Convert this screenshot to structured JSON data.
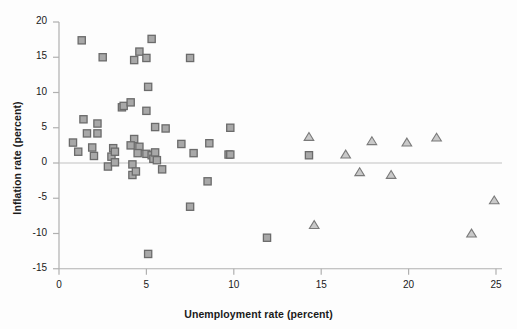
{
  "chart_data": {
    "type": "scatter",
    "title": "",
    "xlabel": "Unemployment rate (percent)",
    "ylabel": "Inflation rate (percent)",
    "xlim": [
      0,
      25
    ],
    "ylim": [
      -15,
      20
    ],
    "xticks": [
      0,
      5,
      10,
      15,
      20,
      25
    ],
    "yticks": [
      20,
      15,
      10,
      5,
      0,
      -5,
      -10,
      -15
    ],
    "xtick_labels": [
      "0",
      "5",
      "10",
      "15",
      "20",
      "25"
    ],
    "ytick_labels": [
      "20",
      "15",
      "10",
      "5",
      "0",
      "-5",
      "-10",
      "-15"
    ],
    "grid": false,
    "legend": "none",
    "zero_line": 0,
    "series": [
      {
        "name": "square-series",
        "marker": "square",
        "fill_color": "#a8a8a8",
        "edge_color": "#6b6b6b",
        "points": [
          [
            1.3,
            17.4
          ],
          [
            2.5,
            15.0
          ],
          [
            4.3,
            14.6
          ],
          [
            4.6,
            15.8
          ],
          [
            5.0,
            14.9
          ],
          [
            5.3,
            17.6
          ],
          [
            7.5,
            14.9
          ],
          [
            5.1,
            10.8
          ],
          [
            3.6,
            7.9
          ],
          [
            3.7,
            8.1
          ],
          [
            4.1,
            8.6
          ],
          [
            5.0,
            7.4
          ],
          [
            1.4,
            6.2
          ],
          [
            2.2,
            5.6
          ],
          [
            5.5,
            5.1
          ],
          [
            6.1,
            4.9
          ],
          [
            9.8,
            5.0
          ],
          [
            1.6,
            4.2
          ],
          [
            2.2,
            4.2
          ],
          [
            0.8,
            2.9
          ],
          [
            4.3,
            3.4
          ],
          [
            4.1,
            2.5
          ],
          [
            7.0,
            2.7
          ],
          [
            8.6,
            2.8
          ],
          [
            4.6,
            2.3
          ],
          [
            3.1,
            2.1
          ],
          [
            1.9,
            2.2
          ],
          [
            1.1,
            1.6
          ],
          [
            2.0,
            1.0
          ],
          [
            3.0,
            0.9
          ],
          [
            3.2,
            1.6
          ],
          [
            4.5,
            1.4
          ],
          [
            5.0,
            1.3
          ],
          [
            5.3,
            1.1
          ],
          [
            5.4,
            0.6
          ],
          [
            5.5,
            1.5
          ],
          [
            5.6,
            0.4
          ],
          [
            7.7,
            1.4
          ],
          [
            9.7,
            1.2
          ],
          [
            9.8,
            1.2
          ],
          [
            14.3,
            1.1
          ],
          [
            2.8,
            -0.5
          ],
          [
            3.2,
            0.1
          ],
          [
            4.2,
            -0.2
          ],
          [
            4.2,
            -1.7
          ],
          [
            4.4,
            -1.2
          ],
          [
            5.9,
            -0.9
          ],
          [
            8.5,
            -2.6
          ],
          [
            7.5,
            -6.2
          ],
          [
            11.9,
            -10.6
          ],
          [
            5.1,
            -12.9
          ]
        ]
      },
      {
        "name": "triangle-series",
        "marker": "triangle",
        "fill_color": "#c9c9c9",
        "edge_color": "#7a7a7a",
        "points": [
          [
            14.3,
            3.7
          ],
          [
            16.4,
            1.2
          ],
          [
            17.9,
            3.1
          ],
          [
            19.0,
            -1.7
          ],
          [
            17.2,
            -1.3
          ],
          [
            19.9,
            2.9
          ],
          [
            21.6,
            3.6
          ],
          [
            14.6,
            -8.8
          ],
          [
            23.6,
            -10.0
          ],
          [
            24.9,
            -5.3
          ]
        ]
      }
    ],
    "colors": {
      "axis": "#b0b0b0",
      "text": "#1a1a1a",
      "zero_line": "#c2c2c2",
      "background": "#fdfdfd"
    }
  }
}
